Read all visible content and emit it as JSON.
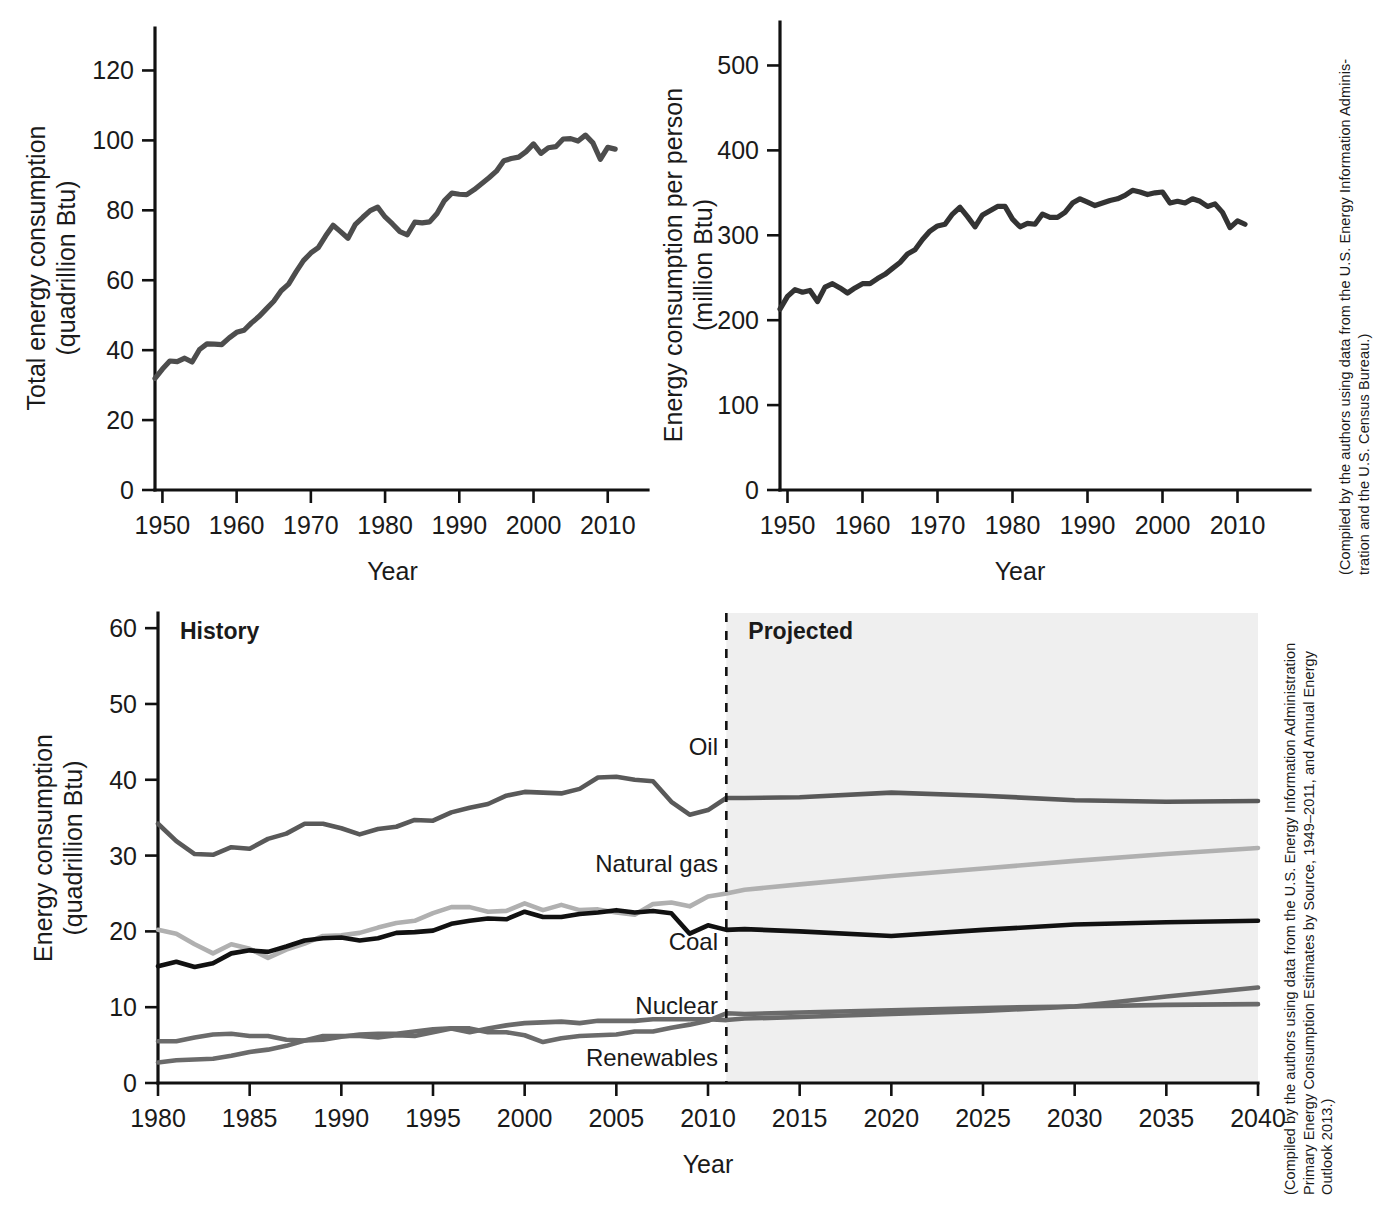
{
  "figure": {
    "panels": [
      "total-energy-consumption",
      "energy-consumption-per-person",
      "energy-consumption-by-source"
    ]
  },
  "captions": {
    "top_right": "(Compiled by the authors using data from the U.S. Energy Information Adminis-\ntration and the U.S. Census Bureau.)",
    "bottom_right": "(Compiled by the authors using data from the U.S. Energy Information Administration\nPrimary Energy Consumption Estimates by Source, 1949–2011, and Annual Energy\nOutlook 2013.)"
  },
  "chart_data": [
    {
      "id": "total-energy-consumption",
      "type": "line",
      "title": "",
      "xlabel": "Year",
      "ylabel": "Total energy consumption\n(quadrillion Btu)",
      "ylabel_line1": "Total energy consumption",
      "ylabel_line2": "(quadrillion Btu)",
      "xlim": [
        1949,
        2013
      ],
      "ylim": [
        0,
        127
      ],
      "xticks": [
        1950,
        1960,
        1970,
        1980,
        1990,
        2000,
        2010
      ],
      "yticks": [
        0,
        20,
        40,
        60,
        80,
        100,
        120
      ],
      "grid": false,
      "legend": "none",
      "series": [
        {
          "name": "Total energy consumption",
          "color": "#4d4d4d",
          "x": [
            1949,
            1950,
            1951,
            1952,
            1953,
            1954,
            1955,
            1956,
            1957,
            1958,
            1959,
            1960,
            1961,
            1962,
            1963,
            1964,
            1965,
            1966,
            1967,
            1968,
            1969,
            1970,
            1971,
            1972,
            1973,
            1974,
            1975,
            1976,
            1977,
            1978,
            1979,
            1980,
            1981,
            1982,
            1983,
            1984,
            1985,
            1986,
            1987,
            1988,
            1989,
            1990,
            1991,
            1992,
            1993,
            1994,
            1995,
            1996,
            1997,
            1998,
            1999,
            2000,
            2001,
            2002,
            2003,
            2004,
            2005,
            2006,
            2007,
            2008,
            2009,
            2010,
            2011
          ],
          "values": [
            31.9,
            34.6,
            36.9,
            36.7,
            37.7,
            36.6,
            40.2,
            41.8,
            41.7,
            41.6,
            43.5,
            45.1,
            45.7,
            47.8,
            49.6,
            51.8,
            54.0,
            57.0,
            58.9,
            62.4,
            65.6,
            67.8,
            69.3,
            72.7,
            75.7,
            73.9,
            72.0,
            76.0,
            78.0,
            79.9,
            80.9,
            78.1,
            76.1,
            73.9,
            73.0,
            76.6,
            76.4,
            76.7,
            79.1,
            82.8,
            84.9,
            84.6,
            84.5,
            85.9,
            87.6,
            89.3,
            91.2,
            94.2,
            94.8,
            95.2,
            96.8,
            99.0,
            96.3,
            97.9,
            98.2,
            100.4,
            100.5,
            99.8,
            101.5,
            99.3,
            94.6,
            98.0,
            97.5
          ]
        }
      ]
    },
    {
      "id": "energy-consumption-per-person",
      "type": "line",
      "title": "",
      "xlabel": "Year",
      "ylabel": "Energy consumption per person\n(million Btu)",
      "ylabel_line1": "Energy consumption per person",
      "ylabel_line2": "(million Btu)",
      "xlim": [
        1949,
        2013
      ],
      "ylim": [
        0,
        530
      ],
      "xticks": [
        1950,
        1960,
        1970,
        1980,
        1990,
        2000,
        2010
      ],
      "yticks": [
        0,
        100,
        200,
        300,
        400,
        500
      ],
      "grid": false,
      "legend": "none",
      "series": [
        {
          "name": "Energy consumption per person",
          "color": "#333333",
          "x": [
            1949,
            1950,
            1951,
            1952,
            1953,
            1954,
            1955,
            1956,
            1957,
            1958,
            1959,
            1960,
            1961,
            1962,
            1963,
            1964,
            1965,
            1966,
            1967,
            1968,
            1969,
            1970,
            1971,
            1972,
            1973,
            1974,
            1975,
            1976,
            1977,
            1978,
            1979,
            1980,
            1981,
            1982,
            1983,
            1984,
            1985,
            1986,
            1987,
            1988,
            1989,
            1990,
            1991,
            1992,
            1993,
            1994,
            1995,
            1996,
            1997,
            1998,
            1999,
            2000,
            2001,
            2002,
            2003,
            2004,
            2005,
            2006,
            2007,
            2008,
            2009,
            2010,
            2011
          ],
          "values": [
            213,
            228,
            236,
            233,
            235,
            222,
            239,
            243,
            238,
            232,
            238,
            243,
            243,
            249,
            254,
            261,
            268,
            278,
            283,
            295,
            305,
            311,
            313,
            325,
            333,
            322,
            310,
            324,
            329,
            334,
            334,
            319,
            310,
            314,
            313,
            325,
            321,
            321,
            327,
            338,
            343,
            339,
            335,
            338,
            341,
            343,
            347,
            353,
            351,
            348,
            350,
            351,
            338,
            340,
            338,
            343,
            340,
            334,
            337,
            327,
            309,
            317,
            313
          ]
        }
      ]
    },
    {
      "id": "energy-consumption-by-source",
      "type": "line",
      "title": "",
      "xlabel": "Year",
      "ylabel": "Energy consumption\n(quadrillion Btu)",
      "ylabel_line1": "Energy consumption",
      "ylabel_line2": "(quadrillion Btu)",
      "xlim": [
        1980,
        2040
      ],
      "ylim": [
        0,
        62
      ],
      "xticks": [
        1980,
        1985,
        1990,
        1995,
        2000,
        2005,
        2010,
        2015,
        2020,
        2025,
        2030,
        2035,
        2040
      ],
      "yticks": [
        0,
        10,
        20,
        30,
        40,
        50,
        60
      ],
      "grid": false,
      "legend": "inline-labels",
      "annotations": {
        "history_label": "History",
        "projected_label": "Projected",
        "divider_year": 2011,
        "projected_shading_color": "#efefef"
      },
      "series": [
        {
          "name": "Oil",
          "label": "Oil",
          "color": "#595959",
          "x": [
            1980,
            1981,
            1982,
            1983,
            1984,
            1985,
            1986,
            1987,
            1988,
            1989,
            1990,
            1991,
            1992,
            1993,
            1994,
            1995,
            1996,
            1997,
            1998,
            1999,
            2000,
            2001,
            2002,
            2003,
            2004,
            2005,
            2006,
            2007,
            2008,
            2009,
            2010,
            2011,
            2012,
            2015,
            2020,
            2025,
            2030,
            2035,
            2040
          ],
          "values": [
            34.2,
            31.9,
            30.2,
            30.1,
            31.1,
            30.9,
            32.2,
            32.9,
            34.2,
            34.2,
            33.6,
            32.8,
            33.5,
            33.8,
            34.7,
            34.6,
            35.7,
            36.3,
            36.8,
            37.9,
            38.4,
            38.3,
            38.2,
            38.8,
            40.3,
            40.4,
            40.0,
            39.8,
            37.1,
            35.4,
            36.0,
            37.6,
            37.6,
            37.7,
            38.3,
            37.9,
            37.3,
            37.1,
            37.2
          ]
        },
        {
          "name": "Natural gas",
          "label": "Natural gas",
          "color": "#b0b0b0",
          "x": [
            1980,
            1981,
            1982,
            1983,
            1984,
            1985,
            1986,
            1987,
            1988,
            1989,
            1990,
            1991,
            1992,
            1993,
            1994,
            1995,
            1996,
            1997,
            1998,
            1999,
            2000,
            2001,
            2002,
            2003,
            2004,
            2005,
            2006,
            2007,
            2008,
            2009,
            2010,
            2011,
            2012,
            2015,
            2020,
            2025,
            2030,
            2035,
            2040
          ],
          "values": [
            20.2,
            19.7,
            18.3,
            17.1,
            18.3,
            17.7,
            16.5,
            17.6,
            18.4,
            19.4,
            19.5,
            19.8,
            20.5,
            21.1,
            21.4,
            22.4,
            23.2,
            23.2,
            22.6,
            22.7,
            23.7,
            22.8,
            23.5,
            22.8,
            22.9,
            22.5,
            22.2,
            23.6,
            23.8,
            23.3,
            24.6,
            25.0,
            25.5,
            26.2,
            27.3,
            28.3,
            29.3,
            30.2,
            31.0
          ]
        },
        {
          "name": "Coal",
          "label": "Coal",
          "color": "#111111",
          "x": [
            1980,
            1981,
            1982,
            1983,
            1984,
            1985,
            1986,
            1987,
            1988,
            1989,
            1990,
            1991,
            1992,
            1993,
            1994,
            1995,
            1996,
            1997,
            1998,
            1999,
            2000,
            2001,
            2002,
            2003,
            2004,
            2005,
            2006,
            2007,
            2008,
            2009,
            2010,
            2011,
            2012,
            2015,
            2020,
            2025,
            2030,
            2035,
            2040
          ],
          "values": [
            15.4,
            16.0,
            15.3,
            15.8,
            17.1,
            17.5,
            17.3,
            18.0,
            18.8,
            19.1,
            19.2,
            18.8,
            19.1,
            19.8,
            19.9,
            20.1,
            21.0,
            21.4,
            21.7,
            21.6,
            22.6,
            21.9,
            21.9,
            22.3,
            22.5,
            22.8,
            22.5,
            22.7,
            22.4,
            19.7,
            20.8,
            20.2,
            20.3,
            20.0,
            19.4,
            20.2,
            20.9,
            21.2,
            21.4
          ]
        },
        {
          "name": "Nuclear",
          "label": "Nuclear",
          "color": "#6b6b6b",
          "x": [
            1980,
            1981,
            1982,
            1983,
            1984,
            1985,
            1986,
            1987,
            1988,
            1989,
            1990,
            1991,
            1992,
            1993,
            1994,
            1995,
            1996,
            1997,
            1998,
            1999,
            2000,
            2001,
            2002,
            2003,
            2004,
            2005,
            2006,
            2007,
            2008,
            2009,
            2010,
            2011,
            2012,
            2015,
            2020,
            2025,
            2030,
            2035,
            2040
          ],
          "values": [
            2.7,
            3.0,
            3.1,
            3.2,
            3.6,
            4.1,
            4.4,
            4.9,
            5.6,
            5.7,
            6.1,
            6.4,
            6.5,
            6.5,
            6.8,
            7.1,
            7.2,
            6.7,
            7.2,
            7.6,
            7.9,
            8.0,
            8.1,
            7.9,
            8.2,
            8.2,
            8.2,
            8.4,
            8.4,
            8.4,
            8.4,
            8.3,
            8.5,
            8.7,
            9.1,
            9.5,
            10.1,
            11.4,
            12.6
          ]
        },
        {
          "name": "Renewables",
          "label": "Renewables",
          "color": "#6b6b6b",
          "x": [
            1980,
            1981,
            1982,
            1983,
            1984,
            1985,
            1986,
            1987,
            1988,
            1989,
            1990,
            1991,
            1992,
            1993,
            1994,
            1995,
            1996,
            1997,
            1998,
            1999,
            2000,
            2001,
            2002,
            2003,
            2004,
            2005,
            2006,
            2007,
            2008,
            2009,
            2010,
            2011,
            2012,
            2015,
            2020,
            2025,
            2030,
            2035,
            2040
          ],
          "values": [
            5.5,
            5.5,
            6.0,
            6.4,
            6.5,
            6.2,
            6.2,
            5.7,
            5.6,
            6.2,
            6.2,
            6.2,
            6.0,
            6.3,
            6.2,
            6.7,
            7.2,
            7.2,
            6.7,
            6.7,
            6.3,
            5.4,
            5.9,
            6.2,
            6.3,
            6.4,
            6.8,
            6.8,
            7.3,
            7.7,
            8.2,
            9.2,
            9.1,
            9.3,
            9.6,
            9.9,
            10.1,
            10.3,
            10.4
          ]
        }
      ]
    }
  ]
}
